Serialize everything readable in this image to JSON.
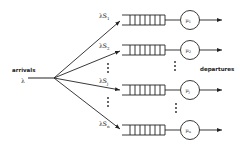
{
  "diagram": {
    "title": "",
    "input": {
      "label": "arrivals",
      "rate": "λ"
    },
    "output": {
      "label": "departures"
    },
    "branches": [
      {
        "prob_label": "λS",
        "sub": "1",
        "server": "μ",
        "server_sub": "1",
        "y": 20
      },
      {
        "prob_label": "λS",
        "sub": "2",
        "server": "μ",
        "server_sub": "2",
        "y": 50
      },
      {
        "prob_label": "λS",
        "sub": "j",
        "server": "μ",
        "server_sub": "j",
        "y": 90
      },
      {
        "prob_label": "λS",
        "sub": "n",
        "server": "μ",
        "server_sub": "n",
        "y": 130
      }
    ],
    "ellipsis": "⋮",
    "colors": {
      "stroke": "#222222",
      "background": "#ffffff"
    }
  }
}
